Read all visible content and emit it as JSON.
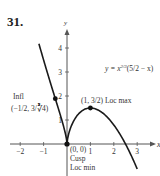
{
  "problem_number": "31.",
  "chart_data": {
    "type": "line",
    "title": "",
    "equation": "y = x^(2/3)(5/2 − x)",
    "equation_label": "y = x",
    "equation_exponent": "2/3",
    "equation_factor": "(5/2 − x)",
    "xlabel": "x",
    "ylabel": "y",
    "xlim": [
      -2.5,
      3.7
    ],
    "ylim": [
      -1.0,
      4.6
    ],
    "x_ticks": [
      -2,
      -1,
      1,
      2,
      3
    ],
    "y_ticks": [
      1,
      2,
      3,
      4
    ],
    "x_tick_labels": [
      "−2",
      "−1",
      "1",
      "2",
      "3"
    ],
    "y_tick_labels": [
      "1",
      "2",
      "3",
      "4"
    ],
    "grid": false,
    "legend": null,
    "series": [
      {
        "name": "y = x^(2/3)(5/2 − x)",
        "x": [
          -1.2,
          -1.0,
          -0.8,
          -0.6,
          -0.5,
          -0.4,
          -0.2,
          0,
          0.2,
          0.4,
          0.6,
          0.8,
          1.0,
          1.2,
          1.5,
          2.0,
          2.5,
          2.8,
          3.0
        ],
        "y": [
          4.2,
          3.5,
          2.83,
          2.19,
          1.89,
          1.58,
          0.92,
          0,
          0.78,
          1.15,
          1.35,
          1.46,
          1.5,
          1.47,
          1.31,
          0.79,
          0,
          -0.59,
          -1.04
        ]
      }
    ],
    "annotations": [
      {
        "point": [
          -0.5,
          1.89
        ],
        "label_line1": "Infl",
        "label_line2": "(−1/2, 3/∛4)"
      },
      {
        "point": [
          1,
          1.5
        ],
        "label": "(1, 3/2) Loc max"
      },
      {
        "point": [
          0,
          0
        ],
        "label_line1": "(0, 0)",
        "label_line2": "Cusp",
        "label_line3": "Loc min"
      }
    ]
  }
}
